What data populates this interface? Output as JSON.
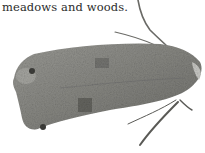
{
  "document": {
    "text_fragment": "meadows and woods.",
    "figure": {
      "subject": "moth-photo",
      "style": "grayscale",
      "colors": {
        "wing_base": "#8a8a86",
        "wing_dark": "#5e5e5a",
        "wing_light": "#a8a8a3",
        "antenna": "#6a6a66",
        "background": "#ffffff"
      }
    }
  }
}
